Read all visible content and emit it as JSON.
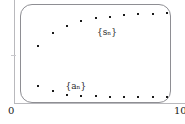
{
  "figure": {
    "title": "",
    "frame": {
      "rounded": true,
      "color": "#8e8e93"
    }
  },
  "axis": {
    "origin_label": "0",
    "xmax_label": "10",
    "y_label": ""
  },
  "labels": {
    "upper_series": "{sₙ}",
    "lower_series": "{aₙ}"
  },
  "chart_data": {
    "type": "scatter",
    "title": "",
    "xlabel": "",
    "ylabel": "",
    "xlim": [
      0,
      10
    ],
    "ylim": [
      0,
      1
    ],
    "grid": false,
    "legend_position": "inline-annotation",
    "x": [
      1,
      2,
      3,
      4,
      5,
      6,
      7,
      8,
      9,
      10
    ],
    "series": [
      {
        "name": "{sₙ}",
        "label_x": 5.1,
        "label_y": 0.78,
        "values": [
          0.58,
          0.72,
          0.8,
          0.855,
          0.885,
          0.905,
          0.92,
          0.93,
          0.935,
          0.94
        ]
      },
      {
        "name": "{aₙ}",
        "label_x": 2.9,
        "label_y": 0.185,
        "values": [
          0.145,
          0.085,
          0.045,
          0.03,
          0.028,
          0.027,
          0.026,
          0.025,
          0.025,
          0.025
        ]
      }
    ]
  }
}
